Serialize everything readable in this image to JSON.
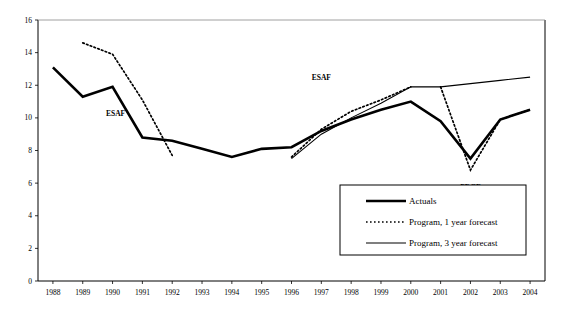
{
  "chart_data": {
    "type": "line",
    "title": "",
    "xlabel": "",
    "ylabel": "",
    "xlim": [
      1987.5,
      2004.5
    ],
    "ylim": [
      0,
      16
    ],
    "yticks": [
      0,
      2,
      4,
      6,
      8,
      10,
      12,
      14,
      16
    ],
    "grid": false,
    "legend_position": "bottom-right",
    "categories": [
      1988,
      1989,
      1990,
      1991,
      1992,
      1993,
      1994,
      1995,
      1996,
      1997,
      1998,
      1999,
      2000,
      2001,
      2002,
      2003,
      2004
    ],
    "tick_labels": [
      "1988",
      "1989",
      "1990",
      "1991",
      "1992",
      "1993",
      "1994",
      "1995",
      "1996",
      "1997",
      "1998",
      "1999",
      "2000",
      "2001",
      "2002",
      "2003",
      "2004"
    ],
    "series": [
      {
        "name": "Actuals",
        "style": "thick-solid",
        "color": "#000000",
        "x": [
          1988,
          1989,
          1990,
          1991,
          1992,
          1993,
          1994,
          1995,
          1996,
          1997,
          1998,
          1999,
          2000,
          2001,
          2002,
          2003,
          2004
        ],
        "values": [
          13.1,
          11.3,
          11.9,
          8.8,
          8.6,
          8.1,
          7.6,
          8.1,
          8.2,
          9.2,
          9.9,
          10.5,
          11.0,
          9.8,
          7.5,
          9.9,
          10.5
        ]
      },
      {
        "name": "Program, 1 year forecast",
        "style": "dotted",
        "color": "#000000",
        "segments": [
          {
            "x": [
              1989,
              1990,
              1991,
              1992
            ],
            "values": [
              14.6,
              13.9,
              11.1,
              7.7
            ]
          },
          {
            "x": [
              1996,
              1997,
              1998,
              1999,
              2000
            ],
            "values": [
              7.6,
              9.3,
              10.4,
              11.1,
              11.9
            ]
          },
          {
            "x": [
              2001,
              2002,
              2003,
              2004
            ],
            "values": [
              11.9,
              6.8,
              9.9,
              10.5
            ]
          }
        ]
      },
      {
        "name": "Program, 3 year forecast",
        "style": "thin-solid",
        "color": "#000000",
        "segments": [
          {
            "x": [
              1996,
              1997,
              1998,
              1999,
              2000,
              2001,
              2002,
              2003,
              2004
            ],
            "values": [
              7.5,
              9.0,
              10.0,
              10.9,
              11.9,
              11.9,
              12.1,
              12.3,
              12.5
            ]
          }
        ]
      }
    ],
    "annotations": [
      {
        "text": "ESAF",
        "x": 1990.1,
        "y": 10.1
      },
      {
        "text": "ESAF",
        "x": 1997.0,
        "y": 12.3
      },
      {
        "text": "PRGF",
        "x": 2002.0,
        "y": 5.6
      }
    ]
  },
  "legend": {
    "items": [
      {
        "label": "Actuals",
        "style": "thick-solid"
      },
      {
        "label": "Program, 1 year forecast",
        "style": "dotted"
      },
      {
        "label": "Program, 3 year forecast",
        "style": "thin-solid"
      }
    ]
  }
}
